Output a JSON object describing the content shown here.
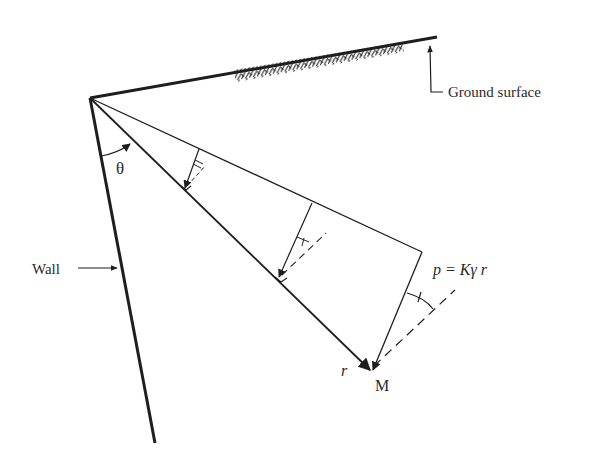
{
  "diagram": {
    "labels": {
      "ground_surface": "Ground surface",
      "wall": "Wall",
      "theta": "θ",
      "pressure_eq": "p = Kγ r",
      "r": "r",
      "M": "M"
    },
    "colors": {
      "stroke": "#1e1e1e",
      "text": "#2a2a2a",
      "background": "#ffffff"
    }
  }
}
